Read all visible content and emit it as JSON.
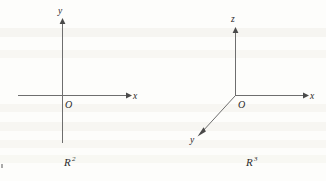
{
  "figure": {
    "background_color": "#fdfdfb",
    "ink_color": "#2b2b2b",
    "axis_color": "#6e6e6e",
    "panels": [
      {
        "id": "r2",
        "caption": "R",
        "caption_superscript": "2",
        "caption_full": "R2",
        "origin_label": "O",
        "axes": [
          {
            "name": "x-axis",
            "label": "x",
            "direction": "right"
          },
          {
            "name": "y-axis",
            "label": "y",
            "direction": "up"
          }
        ]
      },
      {
        "id": "r3",
        "caption": "R",
        "caption_superscript": "3",
        "caption_full": "R3",
        "origin_label": "O",
        "axes": [
          {
            "name": "x-axis",
            "label": "x",
            "direction": "right"
          },
          {
            "name": "y-axis",
            "label": "y",
            "direction": "down-left"
          },
          {
            "name": "z-axis",
            "label": "z",
            "direction": "up"
          }
        ]
      }
    ]
  }
}
